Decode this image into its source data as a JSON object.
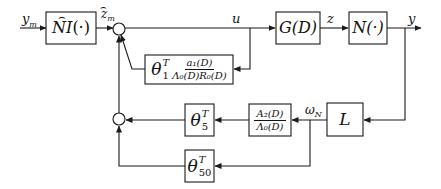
{
  "diagram": {
    "type": "control-system-block-diagram",
    "signals": {
      "input": "y_m",
      "estimated": "ẑ_m",
      "control": "u",
      "intermediate": "z",
      "output": "y",
      "filtered": "ω_N"
    },
    "signal_labels": {
      "ym_main": "y",
      "ym_sub": "m",
      "zm_main": "z",
      "zm_sub": "m",
      "u": "u",
      "z": "z",
      "y": "y",
      "omega_main": "ω",
      "omega_sub": "N"
    },
    "blocks": {
      "ni": {
        "label": "NI(·)",
        "main": "NI",
        "arg": "(·)"
      },
      "g": {
        "label": "G(D)"
      },
      "n": {
        "label": "N(·)"
      },
      "l": {
        "label": "L"
      },
      "theta1": {
        "theta": "θ",
        "sup": "T",
        "sub": "1",
        "num": "a₁(D)",
        "den": "Λ₀(D)R₀(D)"
      },
      "a2": {
        "num": "A₂(D)",
        "den": "Λ₀(D)"
      },
      "theta5": {
        "theta": "θ",
        "sup": "T",
        "sub": "5"
      },
      "theta50": {
        "theta": "θ",
        "sup": "T",
        "sub": "50"
      }
    },
    "summing_junctions": [
      "upper",
      "lower"
    ]
  }
}
